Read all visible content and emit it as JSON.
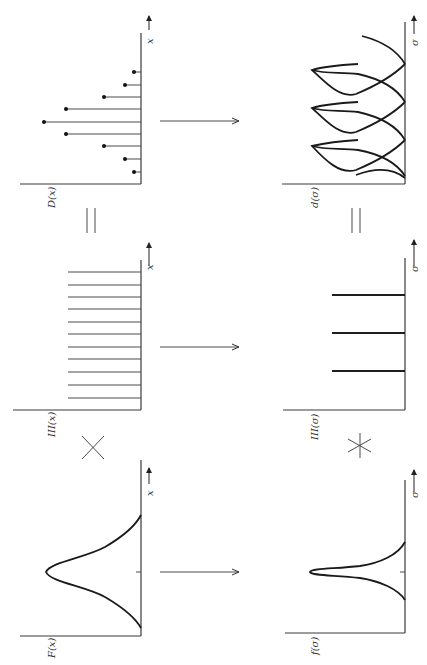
{
  "orientation": "page rotated 90 degrees clockwise",
  "top_row": {
    "panels": [
      {
        "id": "F",
        "label": "F(x)",
        "axis_label": "x",
        "type": "gaussian"
      },
      {
        "id": "IIIx",
        "label": "III(x)",
        "axis_label": "x",
        "type": "comb",
        "count": 11
      },
      {
        "id": "D",
        "label": "D(x)",
        "axis_label": "x",
        "type": "sampled-gaussian",
        "count": 9
      }
    ],
    "operators": [
      "×",
      "="
    ]
  },
  "bottom_row": {
    "panels": [
      {
        "id": "f",
        "label": "f(σ)",
        "axis_label": "σ",
        "type": "narrow-peak"
      },
      {
        "id": "IIIs",
        "label": "III(σ)",
        "axis_label": "σ",
        "type": "comb",
        "count": 3
      },
      {
        "id": "d",
        "label": "d(σ)",
        "axis_label": "σ",
        "type": "periodic-peaks",
        "count": 3
      }
    ],
    "operators": [
      "∗",
      "="
    ]
  },
  "transform_arrows": 3,
  "colors": {
    "ink": "#1e1e1e",
    "background": "#ffffff"
  }
}
